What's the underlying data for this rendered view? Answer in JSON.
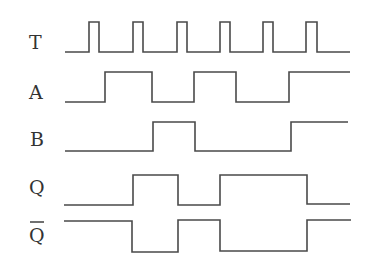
{
  "diagram": {
    "type": "timing-diagram",
    "stroke_color": "#4a4a4a",
    "text_color": "#333333",
    "background": "#ffffff",
    "signals": [
      {
        "name": "T",
        "label": "T",
        "overline": false,
        "label_y": 49,
        "low_y": 52,
        "high_y": 22,
        "points": "65,52 89,52 89,22 99,22 99,52 133,52 133,22 143,22 143,52 177,52 177,22 187,22 187,52 220,52 220,22 230,22 230,52 263,52 263,22 273,22 273,52 306,52 306,22 317,22 317,52 350,52"
      },
      {
        "name": "A",
        "label": "A",
        "overline": false,
        "label_y": 99,
        "low_y": 102,
        "high_y": 72,
        "points": "65,102 105,102 105,72 152,72 152,102 194,102 194,72 236,72 236,102 289,102 289,72 350,72"
      },
      {
        "name": "B",
        "label": "B",
        "overline": false,
        "label_y": 146,
        "low_y": 151,
        "high_y": 122,
        "points": "65,151 153,151 153,122 195,122 195,151 291,151 291,122 348,122"
      },
      {
        "name": "Q",
        "label": "Q",
        "overline": false,
        "label_y": 194,
        "low_y": 205,
        "high_y": 175,
        "points": "64,205 133,205 133,175 178,175 178,205 220,205 220,175 307,175 307,204 350,204"
      },
      {
        "name": "Q-bar",
        "label": "Q",
        "overline": true,
        "label_y": 242,
        "low_y": 252,
        "high_y": 220,
        "points": "64,221 132,221 132,252 178,252 178,220 220,220 220,251 307,251 307,220 351,220"
      }
    ]
  }
}
